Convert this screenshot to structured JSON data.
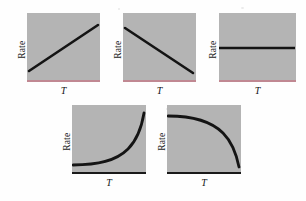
{
  "figure": {
    "background_color": "#fefefe",
    "panel_fill_color": "#b4b4b4",
    "curve_color": "#141414",
    "baseline_red_color": "#c08892",
    "baseline_dark_color": "#1a1a1a",
    "y_axis_label": "Rate",
    "x_axis_label": "T"
  },
  "panels": [
    {
      "id": "panel-linear-increase",
      "row": "top",
      "position": 1,
      "y_axis_label": "Rate",
      "x_axis_label": "T",
      "baseline_style": "red",
      "curve_description": "linear-increase",
      "path": "M 2,58 L 71,12"
    },
    {
      "id": "panel-linear-decrease",
      "row": "top",
      "position": 2,
      "y_axis_label": "Rate",
      "x_axis_label": "T",
      "baseline_style": "red",
      "curve_description": "linear-decrease",
      "path": "M 2,15 L 70,60"
    },
    {
      "id": "panel-constant",
      "row": "top",
      "position": 3,
      "y_axis_label": "Rate",
      "x_axis_label": "T",
      "baseline_style": "red",
      "curve_description": "constant",
      "path": "M 0,35 L 76,35"
    },
    {
      "id": "panel-exponential-increase",
      "row": "bottom",
      "position": 1,
      "y_axis_label": "Rate",
      "x_axis_label": "T",
      "baseline_style": "dark",
      "curve_description": "exponential-increase",
      "path": "M 1,60 C 26,60 44,56 56,44 C 66,34 70,20 72,8"
    },
    {
      "id": "panel-exponential-decrease",
      "row": "bottom",
      "position": 2,
      "y_axis_label": "Rate",
      "x_axis_label": "T",
      "baseline_style": "dark",
      "curve_description": "exponential-decrease",
      "path": "M 1,11 C 26,11 44,16 56,28 C 66,38 70,52 72,62"
    }
  ],
  "chart_data": {
    "type": "line",
    "title": "",
    "xlabel": "T",
    "ylabel": "Rate",
    "grid": false,
    "legend": "none",
    "panel_count": 5,
    "axis_ticks": "none",
    "charts": [
      {
        "name": "Linear increase",
        "type": "line",
        "xlabel": "T",
        "ylabel": "Rate",
        "x": [
          0,
          0.25,
          0.5,
          0.75,
          1.0
        ],
        "y": [
          0.18,
          0.34,
          0.5,
          0.66,
          0.82
        ],
        "xlim": [
          0,
          1
        ],
        "ylim": [
          0,
          1
        ]
      },
      {
        "name": "Linear decrease",
        "type": "line",
        "xlabel": "T",
        "ylabel": "Rate",
        "x": [
          0,
          0.25,
          0.5,
          0.75,
          1.0
        ],
        "y": [
          0.79,
          0.63,
          0.47,
          0.32,
          0.16
        ],
        "xlim": [
          0,
          1
        ],
        "ylim": [
          0,
          1
        ]
      },
      {
        "name": "Constant",
        "type": "line",
        "xlabel": "T",
        "ylabel": "Rate",
        "x": [
          0,
          0.25,
          0.5,
          0.75,
          1.0
        ],
        "y": [
          0.5,
          0.5,
          0.5,
          0.5,
          0.5
        ],
        "xlim": [
          0,
          1
        ],
        "ylim": [
          0,
          1
        ]
      },
      {
        "name": "Exponential increase",
        "type": "line",
        "xlabel": "T",
        "ylabel": "Rate",
        "x": [
          0,
          0.25,
          0.5,
          0.75,
          1.0
        ],
        "y": [
          0.14,
          0.16,
          0.24,
          0.46,
          0.89
        ],
        "xlim": [
          0,
          1
        ],
        "ylim": [
          0,
          1
        ]
      },
      {
        "name": "Exponential decrease",
        "type": "line",
        "xlabel": "T",
        "ylabel": "Rate",
        "x": [
          0,
          0.25,
          0.5,
          0.75,
          1.0
        ],
        "y": [
          0.85,
          0.83,
          0.75,
          0.53,
          0.11
        ],
        "xlim": [
          0,
          1
        ],
        "ylim": [
          0,
          1
        ]
      }
    ]
  }
}
